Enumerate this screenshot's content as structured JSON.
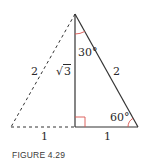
{
  "figure": {
    "caption": "FIGURE 4.29",
    "colors": {
      "line": "#333333",
      "angle_marker": "#d9534f"
    },
    "vertices": {
      "apex": [
        75,
        14
      ],
      "bottom_left": [
        11,
        127
      ],
      "foot": [
        75,
        127
      ],
      "bottom_right": [
        138,
        127
      ]
    },
    "labels": {
      "left_hypotenuse": "2",
      "altitude_radical": "√",
      "altitude_radicand": "3",
      "top_angle": "30°",
      "right_hypotenuse": "2",
      "bottom_right_angle": "60°",
      "left_base": "1",
      "right_base": "1"
    },
    "styles": {
      "left_triangle": "dashed",
      "right_triangle": "solid"
    }
  }
}
